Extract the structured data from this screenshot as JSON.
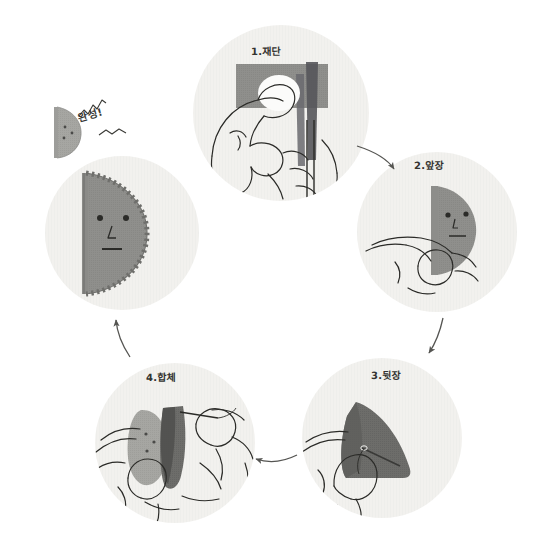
{
  "page": {
    "background_color": "#ffffff",
    "width": 540,
    "height": 552
  },
  "palette": {
    "circle_fill": "#f2f1ee",
    "circle_fill_alt": "#f4f3f0",
    "felt_light": "#a6a6a2",
    "felt_mid": "#8f8f8c",
    "felt_dark": "#6d6d6a",
    "felt_darkest": "#4a4a48",
    "line": "#2b2b28",
    "arrow": "#555552",
    "text": "#333330"
  },
  "steps": [
    {
      "id": "step-1",
      "number": "1",
      "label": "1.재단",
      "meaning": "cutting",
      "circle": {
        "cx": 281,
        "cy": 113,
        "r": 88
      }
    },
    {
      "id": "step-2",
      "number": "2",
      "label": "2.앞장",
      "meaning": "front-piece",
      "circle": {
        "cx": 437,
        "cy": 232,
        "r": 80
      }
    },
    {
      "id": "step-3",
      "number": "3",
      "label": "3.뒷장",
      "meaning": "back-piece",
      "circle": {
        "cx": 382,
        "cy": 438,
        "r": 80
      }
    },
    {
      "id": "step-4",
      "number": "4",
      "label": "4.합체",
      "meaning": "assemble",
      "circle": {
        "cx": 175,
        "cy": 443,
        "r": 80
      }
    },
    {
      "id": "step-done",
      "number": "",
      "label": "완성!",
      "meaning": "complete",
      "circle": {
        "cx": 122,
        "cy": 233,
        "r": 77
      }
    }
  ],
  "arrows": [
    {
      "id": "arrow-1-2",
      "from": "step-1",
      "to": "step-2",
      "direction": "down-right"
    },
    {
      "id": "arrow-2-3",
      "from": "step-2",
      "to": "step-3",
      "direction": "down"
    },
    {
      "id": "arrow-3-4",
      "from": "step-3",
      "to": "step-4",
      "direction": "left"
    },
    {
      "id": "arrow-4-done",
      "from": "step-4",
      "to": "step-done",
      "direction": "up"
    }
  ],
  "decorations": {
    "sparkle_top": "zigzag-line",
    "sparkle_bottom": "zigzag-line"
  }
}
